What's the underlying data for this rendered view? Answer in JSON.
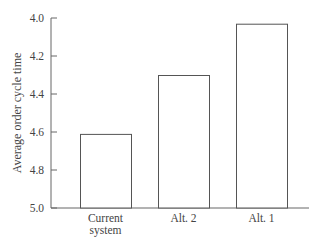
{
  "chart_data": {
    "type": "bar",
    "title": "",
    "xlabel": "",
    "ylabel": "Average order cycle time",
    "y_inverted": true,
    "ylim": [
      4.0,
      5.0
    ],
    "yticks": [
      "4.0",
      "4.2",
      "4.4",
      "4.6",
      "4.8",
      "5.0"
    ],
    "categories": [
      "Current system",
      "Alt. 2",
      "Alt. 1"
    ],
    "category_lines": [
      [
        "Current",
        "system"
      ],
      [
        "Alt. 2"
      ],
      [
        "Alt. 1"
      ]
    ],
    "values": [
      4.61,
      4.3,
      4.03
    ],
    "grid": false,
    "legend": null,
    "bar_fill": "#ffffff",
    "bar_stroke": "#555555"
  }
}
